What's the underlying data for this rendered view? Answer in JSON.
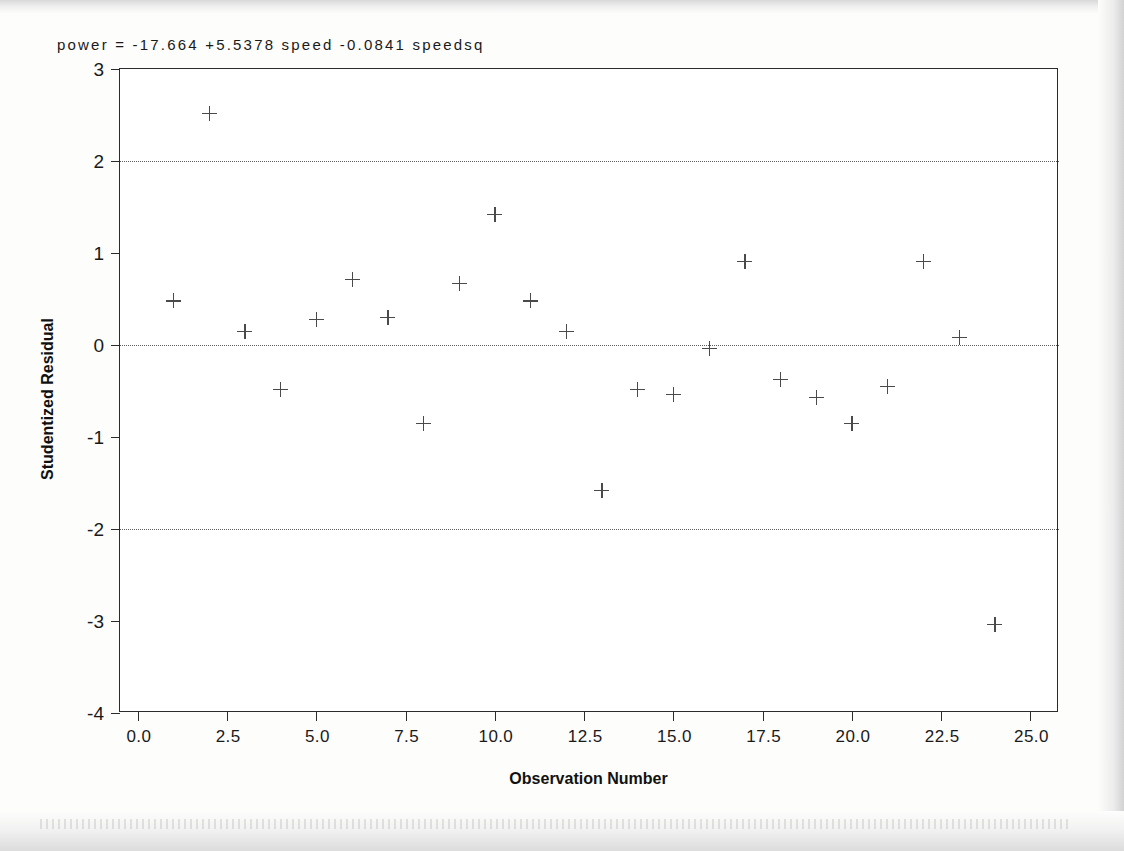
{
  "chart_data": {
    "type": "scatter",
    "title": "power  =  -17.664  +5.5378 speed  -0.0841 speedsq",
    "xlabel": "Observation Number",
    "ylabel": "Studentized Residual",
    "xlim": [
      -0.5,
      25.8
    ],
    "ylim": [
      -4.0,
      3.0
    ],
    "xticks": [
      0.0,
      2.5,
      5.0,
      7.5,
      10.0,
      12.5,
      15.0,
      17.5,
      20.0,
      22.5,
      25.0
    ],
    "xtick_labels": [
      "0.0",
      "2.5",
      "5.0",
      "7.5",
      "10.0",
      "12.5",
      "15.0",
      "17.5",
      "20.0",
      "22.5",
      "25.0"
    ],
    "yticks": [
      3,
      2,
      1,
      0,
      -1,
      -2,
      -3,
      -4
    ],
    "ytick_labels": [
      "3",
      "2",
      "1",
      "0",
      "-1",
      "-2",
      "-3",
      "-4"
    ],
    "grid": false,
    "reference_lines": [
      {
        "y": 2,
        "style": "dotted"
      },
      {
        "y": 0,
        "style": "dotted"
      },
      {
        "y": -2,
        "style": "dotted"
      }
    ],
    "marker": "plus",
    "marker_color": "#4a4a4a",
    "frame_color": "#2b2b2b",
    "background_color": "#ffffff",
    "x": [
      1,
      2,
      3,
      4,
      5,
      6,
      7,
      8,
      9,
      10,
      11,
      12,
      13,
      14,
      15,
      16,
      17,
      18,
      19,
      20,
      21,
      22,
      23,
      24
    ],
    "y": [
      0.48,
      2.52,
      0.15,
      -0.48,
      0.28,
      0.71,
      0.3,
      -0.85,
      0.67,
      1.42,
      0.48,
      0.15,
      -1.58,
      -0.48,
      -0.54,
      -0.04,
      0.91,
      -0.37,
      -0.57,
      -0.85,
      -0.45,
      0.91,
      0.08,
      -3.04
    ],
    "points": [
      {
        "x": 1,
        "y": 0.48
      },
      {
        "x": 2,
        "y": 2.52
      },
      {
        "x": 3,
        "y": 0.15
      },
      {
        "x": 4,
        "y": -0.48
      },
      {
        "x": 5,
        "y": 0.28
      },
      {
        "x": 6,
        "y": 0.71
      },
      {
        "x": 7,
        "y": 0.3
      },
      {
        "x": 8,
        "y": -0.85
      },
      {
        "x": 9,
        "y": 0.67
      },
      {
        "x": 10,
        "y": 1.42
      },
      {
        "x": 11,
        "y": 0.48
      },
      {
        "x": 12,
        "y": 0.15
      },
      {
        "x": 13,
        "y": -1.58
      },
      {
        "x": 14,
        "y": -0.48
      },
      {
        "x": 15,
        "y": -0.54
      },
      {
        "x": 16,
        "y": -0.04
      },
      {
        "x": 17,
        "y": 0.91
      },
      {
        "x": 18,
        "y": -0.37
      },
      {
        "x": 19,
        "y": -0.57
      },
      {
        "x": 20,
        "y": -0.85
      },
      {
        "x": 21,
        "y": -0.45
      },
      {
        "x": 22,
        "y": 0.91
      },
      {
        "x": 23,
        "y": 0.08
      },
      {
        "x": 24,
        "y": -3.04
      }
    ],
    "model": {
      "response": "power",
      "intercept": -17.664,
      "terms": [
        {
          "coefficient": 5.5378,
          "variable": "speed"
        },
        {
          "coefficient": -0.0841,
          "variable": "speedsq"
        }
      ]
    }
  }
}
